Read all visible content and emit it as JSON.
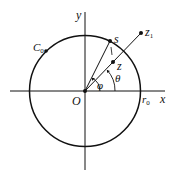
{
  "figure": {
    "type": "complex-plane-circle-diagram",
    "labels": {
      "y_axis": "y",
      "x_axis": "x",
      "origin": "O",
      "circle": "C",
      "circle_sub": "0",
      "radius": "r",
      "radius_sub": "0",
      "point_s": "s",
      "point_z": "z",
      "point_z1": "z",
      "point_z1_sub": "1",
      "angle_phi": "φ",
      "angle_theta": "θ"
    },
    "colors": {
      "stroke": "#111111",
      "background": "#ffffff"
    }
  }
}
